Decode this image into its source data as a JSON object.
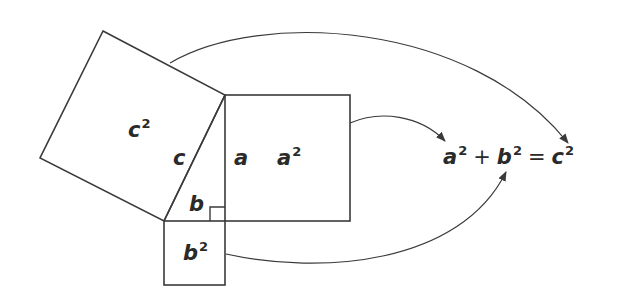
{
  "diagram": {
    "type": "pythagorean-theorem",
    "stroke_color": "#3a3a3a",
    "labels": {
      "c_square": {
        "base": "c",
        "exp": "2"
      },
      "a_square": {
        "base": "a",
        "exp": "2"
      },
      "b_square": {
        "base": "b",
        "exp": "2"
      },
      "side_c": "c",
      "side_a": "a",
      "side_b": "b"
    },
    "equation": {
      "term1": {
        "base": "a",
        "exp": "2"
      },
      "plus": "+",
      "term2": {
        "base": "b",
        "exp": "2"
      },
      "equals": "=",
      "term3": {
        "base": "c",
        "exp": "2"
      }
    }
  }
}
